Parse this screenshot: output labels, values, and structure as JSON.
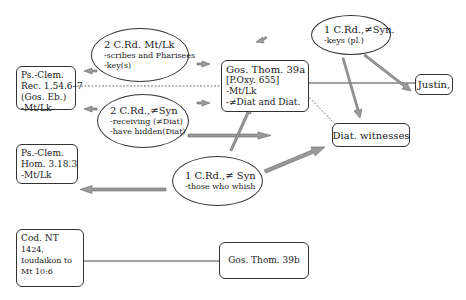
{
  "nodes": {
    "psclem_rec": {
      "lines": [
        "Ps.-Clem.",
        "Rec. 1.54.6–7",
        "(Gos. Eb.)",
        "-Mt/Lk"
      ]
    },
    "psclem_hom": {
      "lines": [
        "Ps.-Clem.",
        "Hom. 3.18.3",
        "-Mt/Lk"
      ]
    },
    "cod_nt": {
      "lines": [
        "Cod. NT",
        "1424,",
        "Ioudaikon to",
        "Mt 10:6"
      ]
    },
    "gos_thom_39a": {
      "lines": [
        "Gos. Thom. 39a",
        "[P.Oxy. 655]",
        "-Mt/Lk",
        "-≠Diat and Diat."
      ]
    },
    "gos_thom_39b": {
      "lines": [
        "Gos. Thom. 39b"
      ]
    },
    "justin": {
      "lines": [
        "Justin,"
      ]
    },
    "diat_witnesses": {
      "lines": [
        "Diat. witnesses"
      ]
    },
    "ell_2crd_mtlk": {
      "title": "2 C.Rd. Mt/Lk",
      "lines": [
        "-scribes and Pharisees",
        "-key(s)"
      ]
    },
    "ell_2crd_nesyn": {
      "title": "2 C.Rd.,≠Syn",
      "lines": [
        "-receiving (≠Diat)",
        "-have hidden(Diat)"
      ]
    },
    "ell_1crd_keys": {
      "title": "1 C.Rd.,≠Syn.",
      "lines": [
        "-keys (pl.)"
      ]
    },
    "ell_1crd_whish": {
      "title": "1 C.Rd.,≠ Syn",
      "lines": [
        "-those who whish"
      ]
    }
  },
  "colors": {
    "arrow_fill": "#9a9a9a",
    "arrow_stroke": "#666666",
    "line": "#333333"
  }
}
